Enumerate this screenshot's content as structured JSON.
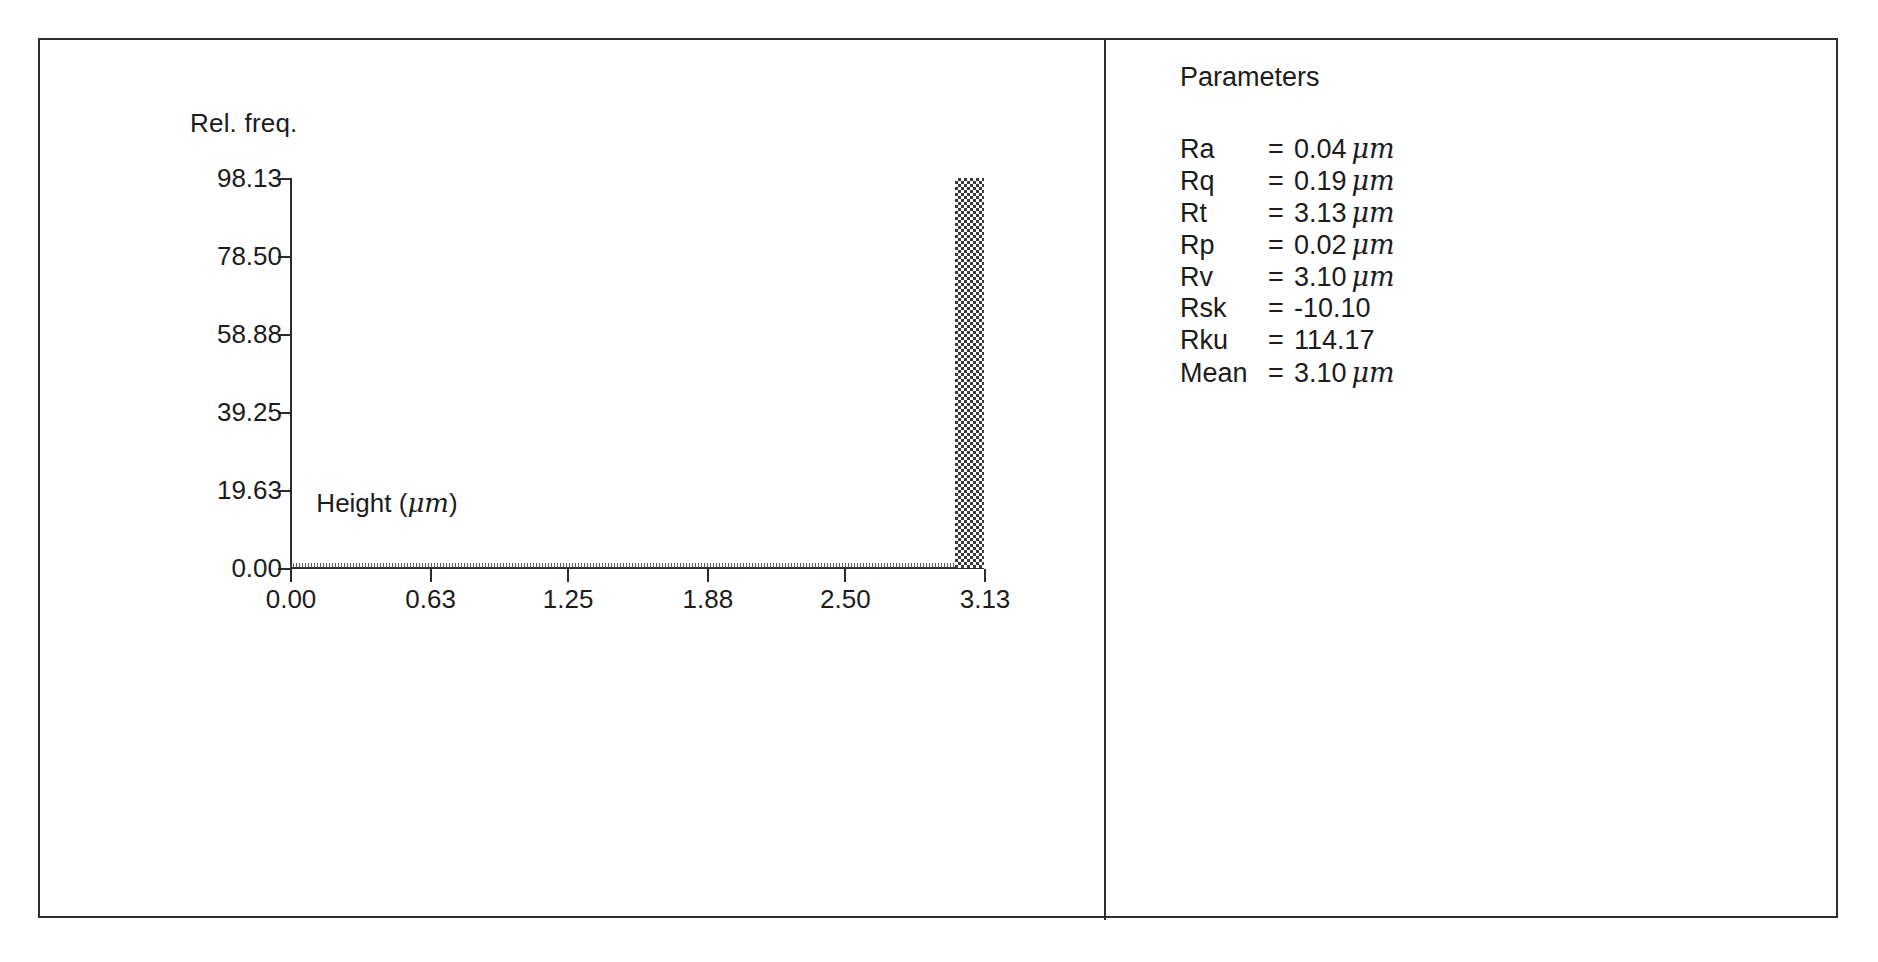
{
  "chart_data": {
    "type": "bar",
    "title": "",
    "subtitle": "",
    "xlabel": "Height (μm)",
    "ylabel": "Rel. freq.",
    "xlabel_text": "Height",
    "xlabel_unit": "μm",
    "grid": false,
    "legend": "none",
    "xlim": [
      0.0,
      3.13
    ],
    "ylim": [
      0.0,
      98.13
    ],
    "xticks": [
      "0.00",
      "0.63",
      "1.25",
      "1.88",
      "2.50",
      "3.13"
    ],
    "xtick_values": [
      0.0,
      0.63,
      1.25,
      1.88,
      2.5,
      3.13
    ],
    "yticks": [
      "0.00",
      "19.63",
      "39.25",
      "58.88",
      "78.50",
      "98.13"
    ],
    "ytick_values": [
      0.0,
      19.63,
      39.25,
      58.88,
      78.5,
      98.13
    ],
    "bin_width": 0.0313,
    "categories": [
      "3.10"
    ],
    "values": [
      98.13
    ],
    "bars": [
      {
        "x_center": 3.065,
        "x_left": 3.0,
        "x_right": 3.13,
        "value": 98.13,
        "fill": "checkerboard-dither"
      }
    ],
    "baseline_note": "all other bins are at or near 0.00 rel. freq.",
    "series": [
      {
        "name": "Rel. freq.",
        "values": [
          98.13
        ]
      }
    ]
  },
  "chart": {
    "ylabel": "Rel. freq.",
    "xlabel_text": "Height",
    "xlabel_unit": "μm",
    "yticks": [
      "98.13",
      "78.50",
      "58.88",
      "39.25",
      "19.63",
      "0.00"
    ],
    "xticks": [
      "0.00",
      "0.63",
      "1.25",
      "1.88",
      "2.50",
      "3.13"
    ]
  },
  "parameters": {
    "title": "Parameters",
    "equals": "=",
    "rows": [
      {
        "name": "Ra",
        "value": "0.04",
        "unit": "μm"
      },
      {
        "name": "Rq",
        "value": "0.19",
        "unit": "μm"
      },
      {
        "name": "Rt",
        "value": "3.13",
        "unit": "μm"
      },
      {
        "name": "Rp",
        "value": "0.02",
        "unit": "μm"
      },
      {
        "name": "Rv",
        "value": "3.10",
        "unit": "μm"
      },
      {
        "name": "Rsk",
        "value": "-10.10",
        "unit": ""
      },
      {
        "name": "Rku",
        "value": "114.17",
        "unit": ""
      },
      {
        "name": "Mean",
        "value": "3.10",
        "unit": "μm"
      }
    ]
  },
  "colors": {
    "frame": "#2e2e2e",
    "axis": "#2b2b2b",
    "bar_fill": "#3a3a3a",
    "text": "#1c1c1c",
    "background": "#ffffff"
  }
}
